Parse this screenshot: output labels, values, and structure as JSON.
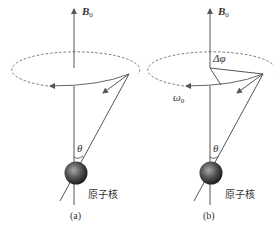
{
  "figure": {
    "panels": [
      {
        "id": "a",
        "caption": "(a)",
        "field_label": "B",
        "field_subscript": "0",
        "angle_label": "θ",
        "nucleus_label": "原子核"
      },
      {
        "id": "b",
        "caption": "(b)",
        "field_label": "B",
        "field_subscript": "0",
        "angle_label": "θ",
        "phase_label": "Δφ",
        "frequency_label": "ω",
        "frequency_subscript": "0",
        "nucleus_label": "原子核"
      }
    ],
    "colors": {
      "line": "#555555",
      "dashed": "#666666",
      "sphere_light": "#9a9a9a",
      "sphere_dark": "#1e1e1e",
      "text": "#333333"
    }
  }
}
